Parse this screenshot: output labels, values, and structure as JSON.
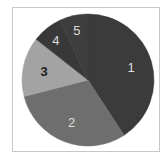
{
  "chart_data": {
    "type": "pie",
    "title": "",
    "categories": [
      "1",
      "2",
      "3",
      "4",
      "5"
    ],
    "values": [
      40.8,
      30.2,
      14.6,
      7.4,
      7.0
    ],
    "colors": [
      "#3b3b3b",
      "#6e6e6e",
      "#a3a3a3",
      "#383838",
      "#3d3d3d"
    ],
    "label_colors": [
      "#dddddd",
      "#dddddd",
      "#1e1e1e",
      "#dddddd",
      "#dddddd"
    ],
    "start_angle_deg": 0,
    "direction": "clockwise",
    "legend": "none",
    "labels_inside": true
  }
}
